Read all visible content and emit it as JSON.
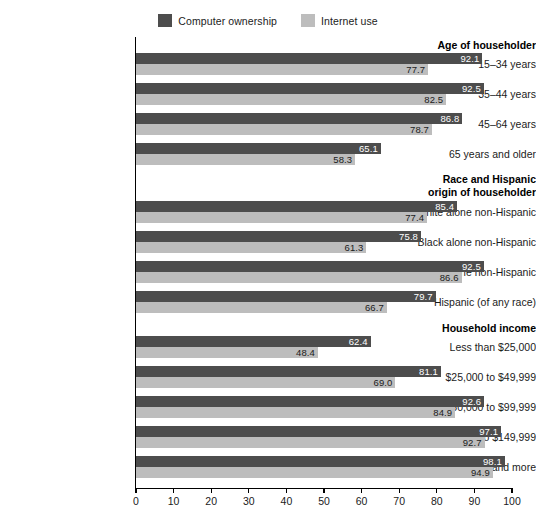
{
  "legend": {
    "entries": [
      {
        "label": "Computer ownership",
        "color": "#4d4d4d",
        "icon": "legend-swatch-dark"
      },
      {
        "label": "Internet use",
        "color": "#bdbdbd",
        "icon": "legend-swatch-light"
      }
    ]
  },
  "axis": {
    "ticks": [
      "0",
      "10",
      "20",
      "30",
      "40",
      "50",
      "60",
      "70",
      "80",
      "90",
      "100"
    ]
  },
  "chart_data": {
    "type": "bar",
    "orientation": "horizontal",
    "title": "",
    "subtitle": "",
    "xlabel": "",
    "ylabel": "",
    "xlim": [
      0,
      100
    ],
    "xticks": [
      0,
      10,
      20,
      30,
      40,
      50,
      60,
      70,
      80,
      90,
      100
    ],
    "grid": false,
    "legend_position": "top-center",
    "series": [
      {
        "name": "Computer ownership",
        "color": "#4d4d4d",
        "values": [
          92.1,
          92.5,
          86.8,
          65.1,
          85.4,
          75.8,
          92.5,
          79.7,
          62.4,
          81.1,
          92.6,
          97.1,
          98.1
        ]
      },
      {
        "name": "Internet use",
        "color": "#bdbdbd",
        "values": [
          77.7,
          82.5,
          78.7,
          58.3,
          77.4,
          61.3,
          86.6,
          66.7,
          48.4,
          69.0,
          84.9,
          92.7,
          94.9
        ]
      }
    ],
    "categories": [
      "15–34 years",
      "35–44 years",
      "45–64 years",
      "65 years and older",
      "White alone non-Hispanic",
      "Black alone non-Hispanic",
      "Asian alone non-Hispanic",
      "Hispanic (of any race)",
      "Less than $25,000",
      "$25,000 to $49,999",
      "$50,000 to $99,999",
      "$100,000 to $149,999",
      "$150,000 and more"
    ],
    "group_headers": [
      {
        "label": "Age of householder",
        "before_category": "15–34 years"
      },
      {
        "label": "Race and Hispanic origin of householder",
        "before_category": "White alone non-Hispanic"
      },
      {
        "label": "Household income",
        "before_category": "Less than $25,000"
      }
    ]
  },
  "rows": [
    {
      "kind": "header",
      "label": "Age of householder",
      "lines": [
        "Age of householder"
      ]
    },
    {
      "kind": "data",
      "label": "15–34 years",
      "dark": 92.1,
      "light": 77.7,
      "dark_text": "92.1",
      "light_text": "77.7"
    },
    {
      "kind": "data",
      "label": "35–44 years",
      "dark": 92.5,
      "light": 82.5,
      "dark_text": "92.5",
      "light_text": "82.5"
    },
    {
      "kind": "data",
      "label": "45–64 years",
      "dark": 86.8,
      "light": 78.7,
      "dark_text": "86.8",
      "light_text": "78.7"
    },
    {
      "kind": "data",
      "label": "65 years and older",
      "dark": 65.1,
      "light": 58.3,
      "dark_text": "65.1",
      "light_text": "58.3"
    },
    {
      "kind": "header",
      "label": "Race and Hispanic origin of householder",
      "lines": [
        "Race and Hispanic",
        "origin of householder"
      ]
    },
    {
      "kind": "data",
      "label": "White alone non-Hispanic",
      "dark": 85.4,
      "light": 77.4,
      "dark_text": "85.4",
      "light_text": "77.4"
    },
    {
      "kind": "data",
      "label": "Black alone non-Hispanic",
      "dark": 75.8,
      "light": 61.3,
      "dark_text": "75.8",
      "light_text": "61.3"
    },
    {
      "kind": "data",
      "label": "Asian alone non-Hispanic",
      "dark": 92.5,
      "light": 86.6,
      "dark_text": "92.5",
      "light_text": "86.6"
    },
    {
      "kind": "data",
      "label": "Hispanic (of any race)",
      "dark": 79.7,
      "light": 66.7,
      "dark_text": "79.7",
      "light_text": "66.7"
    },
    {
      "kind": "header",
      "label": "Household income",
      "lines": [
        "Household income"
      ]
    },
    {
      "kind": "data",
      "label": "Less than $25,000",
      "dark": 62.4,
      "light": 48.4,
      "dark_text": "62.4",
      "light_text": "48.4"
    },
    {
      "kind": "data",
      "label": "$25,000 to $49,999",
      "dark": 81.1,
      "light": 69.0,
      "dark_text": "81.1",
      "light_text": "69.0"
    },
    {
      "kind": "data",
      "label": "$50,000 to $99,999",
      "dark": 92.6,
      "light": 84.9,
      "dark_text": "92.6",
      "light_text": "84.9"
    },
    {
      "kind": "data",
      "label": "$100,000 to $149,999",
      "dark": 97.1,
      "light": 92.7,
      "dark_text": "97.1",
      "light_text": "92.7"
    },
    {
      "kind": "data",
      "label": "$150,000 and more",
      "dark": 98.1,
      "light": 94.9,
      "dark_text": "98.1",
      "light_text": "94.9"
    }
  ]
}
